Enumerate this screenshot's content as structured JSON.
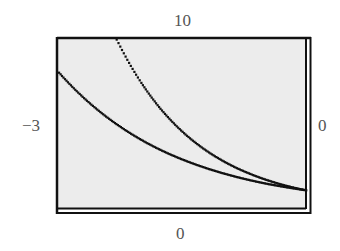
{
  "window": {
    "xmin": "-3",
    "xmax": "0",
    "ymin": "0",
    "ymax": "10"
  },
  "colors": {
    "plot_background": "#ececec",
    "frame": "#111111",
    "curve": "#111111",
    "label": "#555555"
  },
  "chart_data": {
    "type": "line",
    "title": "",
    "xlabel": "",
    "ylabel": "",
    "xlim": [
      -3,
      0
    ],
    "ylim": [
      0,
      10
    ],
    "grid": false,
    "legend": "none",
    "tick_labels": {
      "left": "-3",
      "right": "0",
      "top": "10",
      "bottom": "0"
    },
    "series": [
      {
        "name": "upper curve (approx. y = e^(-x))",
        "x": [
          -2.3,
          -2.0,
          -1.75,
          -1.5,
          -1.25,
          -1.0,
          -0.75,
          -0.5,
          -0.25,
          0.0
        ],
        "values": [
          9.97,
          7.39,
          5.75,
          4.48,
          3.49,
          2.72,
          2.12,
          1.65,
          1.28,
          1.0
        ]
      },
      {
        "name": "lower curve (approx. y = 2^(-x))",
        "x": [
          -3.0,
          -2.75,
          -2.5,
          -2.25,
          -2.0,
          -1.75,
          -1.5,
          -1.25,
          -1.0,
          -0.75,
          -0.5,
          -0.25,
          0.0
        ],
        "values": [
          8.0,
          6.73,
          5.66,
          4.76,
          4.0,
          3.36,
          2.83,
          2.38,
          2.0,
          1.68,
          1.41,
          1.19,
          1.0
        ]
      }
    ]
  }
}
